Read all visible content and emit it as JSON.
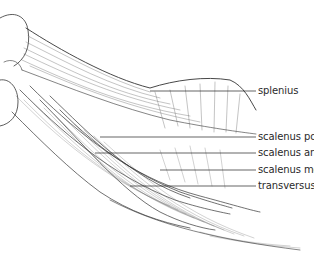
{
  "figure": {
    "type": "anatomical illustration"
  },
  "labels": [
    {
      "text": "splenius",
      "x": 258,
      "y": 85,
      "line_from_x": 150,
      "line_y": 91
    },
    {
      "text": "scalenus posterior",
      "x": 258,
      "y": 131,
      "line_from_x": 100,
      "line_y": 137
    },
    {
      "text": "scalenus anterior",
      "x": 258,
      "y": 147,
      "line_from_x": 95,
      "line_y": 153
    },
    {
      "text": "scalenus medius",
      "x": 258,
      "y": 164,
      "line_from_x": 160,
      "line_y": 170
    },
    {
      "text": "transversus costarum",
      "x": 258,
      "y": 180,
      "line_from_x": 130,
      "line_y": 186
    }
  ],
  "colors": {
    "ink": "#2a2a2a",
    "background": "#ffffff"
  }
}
